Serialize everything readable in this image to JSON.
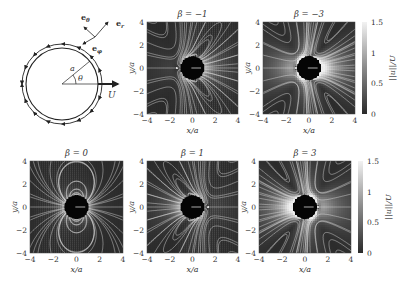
{
  "figure": {
    "schematic": {
      "labels": {
        "e_theta": "e",
        "e_theta_sub": "θ",
        "e_r": "e",
        "e_r_sub": "r",
        "e_phi": "e",
        "e_phi_sub": "φ",
        "radius": "a",
        "angle": "θ",
        "velocity": "U"
      }
    },
    "colorbar": {
      "label": "||u||/U",
      "ticks": [
        "0",
        "0.5",
        "1",
        "1.5"
      ],
      "tick_values": [
        0,
        0.5,
        1,
        1.5
      ],
      "range": [
        0,
        1.5
      ],
      "colormap": "grayscale (dark = 0, light = 1.5)"
    }
  },
  "chart_data": {
    "type": "heatmap",
    "xlabel": "x/a",
    "ylabel": "y/a",
    "xlim": [
      -4,
      4
    ],
    "ylim": [
      -4,
      4
    ],
    "xticks": [
      "−4",
      "−2",
      "0",
      "2",
      "4"
    ],
    "yticks": [
      "−4",
      "−2",
      "0",
      "2",
      "4"
    ],
    "xtick_values": [
      -4,
      -2,
      0,
      2,
      4
    ],
    "ytick_values": [
      -4,
      -2,
      0,
      2,
      4
    ],
    "colorbar": {
      "label": "||u||/U",
      "min": 0,
      "max": 1.5,
      "ticks": [
        0,
        0.5,
        1,
        1.5
      ]
    },
    "panels": [
      {
        "title": "β = −1",
        "beta": -1,
        "row": 1,
        "col": 2
      },
      {
        "title": "β = −3",
        "beta": -3,
        "row": 1,
        "col": 3
      },
      {
        "title": "β = 0",
        "beta": 0,
        "row": 2,
        "col": 1
      },
      {
        "title": "β = 1",
        "beta": 1,
        "row": 2,
        "col": 2
      },
      {
        "title": "β = 3",
        "beta": 3,
        "row": 2,
        "col": 3
      }
    ],
    "grid": false,
    "legend": "colorbar right of each row"
  }
}
